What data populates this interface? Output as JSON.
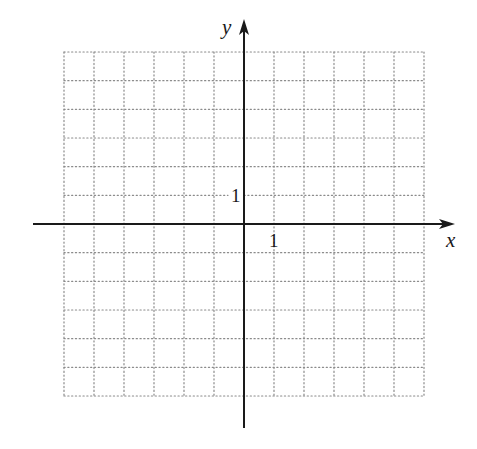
{
  "diagram": {
    "type": "coordinate-grid",
    "axes": {
      "x_label": "x",
      "y_label": "y",
      "origin_px": [
        244,
        224
      ],
      "x_axis_px": {
        "start": 33,
        "end": 455
      },
      "y_axis_px": {
        "start": 428,
        "end": 19
      },
      "color": "#1a1a1a"
    },
    "grid": {
      "x_min": -6,
      "x_max": 6,
      "y_min": -6,
      "y_max": 6,
      "unit_px_x": 30,
      "unit_px_y": 28.67,
      "line_style": "dotted",
      "color": "#8a8a8a"
    },
    "tick_labels": {
      "x_one": "1",
      "y_one": "1"
    }
  }
}
